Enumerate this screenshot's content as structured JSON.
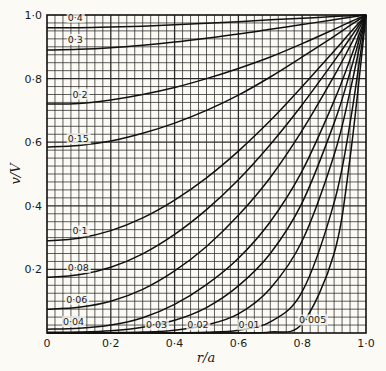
{
  "chart_data": {
    "type": "line",
    "title": "",
    "xlabel": "r/a",
    "ylabel": "v/V",
    "xlim": [
      0,
      1.0
    ],
    "ylim": [
      0,
      1.0
    ],
    "grid": true,
    "grid_step": 0.025,
    "x_ticks": [
      "0",
      "0·2",
      "0·4",
      "0·6",
      "0·8",
      "1·0"
    ],
    "y_ticks": [
      "0",
      "0·2",
      "0·4",
      "0·6",
      "0·8",
      "1·0"
    ],
    "legend": "none (curves labelled inline)",
    "x": [
      0,
      0.1,
      0.2,
      0.3,
      0.4,
      0.5,
      0.6,
      0.7,
      0.8,
      0.9,
      0.95,
      1.0
    ],
    "series": [
      {
        "name": "0·4",
        "values": [
          0.96,
          0.96,
          0.962,
          0.965,
          0.969,
          0.974,
          0.979,
          0.985,
          0.99,
          0.995,
          0.998,
          1.0
        ],
        "label_pos": [
          0.065,
          0.982
        ]
      },
      {
        "name": "0·3",
        "values": [
          0.89,
          0.892,
          0.897,
          0.905,
          0.915,
          0.927,
          0.94,
          0.955,
          0.97,
          0.985,
          0.993,
          1.0
        ],
        "label_pos": [
          0.065,
          0.912
        ]
      },
      {
        "name": "0·2",
        "values": [
          0.72,
          0.722,
          0.733,
          0.75,
          0.772,
          0.8,
          0.832,
          0.868,
          0.91,
          0.955,
          0.978,
          1.0
        ],
        "label_pos": [
          0.08,
          0.74
        ]
      },
      {
        "name": "0·15",
        "values": [
          0.585,
          0.59,
          0.604,
          0.628,
          0.66,
          0.7,
          0.748,
          0.805,
          0.868,
          0.933,
          0.967,
          1.0
        ],
        "label_pos": [
          0.065,
          0.6
        ]
      },
      {
        "name": "0·1",
        "values": [
          0.29,
          0.298,
          0.322,
          0.362,
          0.418,
          0.488,
          0.572,
          0.668,
          0.775,
          0.887,
          0.944,
          1.0
        ],
        "label_pos": [
          0.08,
          0.31
        ]
      },
      {
        "name": "0·08",
        "values": [
          0.175,
          0.183,
          0.207,
          0.249,
          0.31,
          0.388,
          0.482,
          0.593,
          0.718,
          0.855,
          0.927,
          1.0
        ],
        "label_pos": [
          0.065,
          0.195
        ]
      },
      {
        "name": "0·06",
        "values": [
          0.075,
          0.081,
          0.1,
          0.137,
          0.195,
          0.272,
          0.37,
          0.489,
          0.637,
          0.808,
          0.902,
          1.0
        ],
        "label_pos": [
          0.06,
          0.095
        ]
      },
      {
        "name": "0·04",
        "values": [
          0.012,
          0.015,
          0.025,
          0.048,
          0.09,
          0.152,
          0.235,
          0.35,
          0.51,
          0.73,
          0.86,
          1.0
        ],
        "label_pos": [
          0.05,
          0.025
        ]
      },
      {
        "name": "0·03",
        "values": [
          0.002,
          0.003,
          0.007,
          0.018,
          0.04,
          0.08,
          0.148,
          0.25,
          0.41,
          0.66,
          0.82,
          1.0
        ],
        "label_pos": [
          0.31,
          0.015
        ]
      },
      {
        "name": "0·02",
        "values": [
          0,
          0,
          0.001,
          0.003,
          0.009,
          0.025,
          0.06,
          0.14,
          0.29,
          0.56,
          0.76,
          1.0
        ],
        "label_pos": [
          0.44,
          0.015
        ]
      },
      {
        "name": "0·01",
        "values": [
          0,
          0,
          0,
          0,
          0,
          0.002,
          0.009,
          0.035,
          0.13,
          0.41,
          0.66,
          1.0
        ],
        "label_pos": [
          0.6,
          0.015
        ]
      },
      {
        "name": "0·005",
        "values": [
          0,
          0,
          0,
          0,
          0,
          0,
          0,
          0.003,
          0.03,
          0.25,
          0.55,
          1.0
        ],
        "label_pos": [
          0.79,
          0.03
        ]
      }
    ]
  },
  "colors": {
    "background": "#fbfaf4",
    "grid": "#2a2a2a",
    "curve": "#111111"
  }
}
